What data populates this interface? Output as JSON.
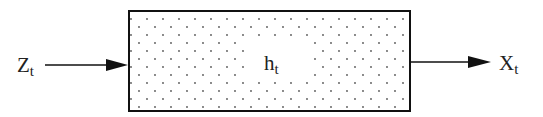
{
  "diagram": {
    "input": {
      "symbol": "Z",
      "subscript": "t"
    },
    "state": {
      "symbol": "h",
      "subscript": "t"
    },
    "output": {
      "symbol": "X",
      "subscript": "t"
    },
    "colors": {
      "stroke": "#111111",
      "dots": "#555555",
      "background": "#ffffff"
    }
  }
}
